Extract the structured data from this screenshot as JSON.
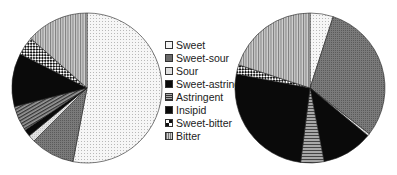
{
  "chart_data": [
    {
      "type": "pie",
      "title": "",
      "position": "left",
      "categories": [
        "Sweet",
        "Sweet-sour",
        "Sour",
        "Sweet-astringent",
        "Astringent",
        "Insipid",
        "Sweet-bitter",
        "Bitter"
      ],
      "values": [
        53,
        9.5,
        1.5,
        1.5,
        5.5,
        11.5,
        4,
        13.5
      ]
    },
    {
      "type": "pie",
      "title": "",
      "position": "right",
      "categories": [
        "Sweet",
        "Sweet-sour",
        "Sour",
        "Sweet-astringent",
        "Astringent",
        "Insipid",
        "Sweet-bitter",
        "Bitter"
      ],
      "values": [
        5,
        30.5,
        0.5,
        11,
        5,
        26,
        2,
        20
      ]
    }
  ],
  "legend": {
    "position": "center",
    "items": [
      {
        "label": "Sweet",
        "pattern": "dots-light"
      },
      {
        "label": "Sweet-sour",
        "pattern": "dark-gray"
      },
      {
        "label": "Sour",
        "pattern": "light-gray"
      },
      {
        "label": "Sweet-astringent",
        "pattern": "black"
      },
      {
        "label": "Astringent",
        "pattern": "stripes"
      },
      {
        "label": "Insipid",
        "pattern": "black"
      },
      {
        "label": "Sweet-bitter",
        "pattern": "checker"
      },
      {
        "label": "Bitter",
        "pattern": "vertical-stripes"
      }
    ]
  },
  "colors": {
    "outline": "#222222",
    "dark_gray": "#6a6a6a",
    "light_gray": "#d8d8d8",
    "black": "#0a0a0a",
    "dots_bg": "#f4f4f4"
  }
}
